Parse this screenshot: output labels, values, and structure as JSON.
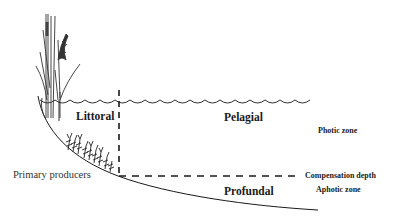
{
  "diagram": {
    "type": "lake-zonation",
    "labels": {
      "littoral": "Littoral",
      "pelagial": "Pelagial",
      "profundal": "Profundal",
      "photic_zone": "Photic zone",
      "aphotic_zone": "Aphotic zone",
      "compensation_depth": "Compensation depth",
      "primary_producers": "Primary producers"
    },
    "elements": {
      "water_surface": "wavy-line",
      "littoral_boundary": "vertical-dashed-line",
      "compensation_line": "horizontal-dashed-line",
      "lake_basin": "curved-bottom-line",
      "emergent_plants": "reed-and-cattail-icon",
      "submerged_plants": "submerged-macrophyte-icon"
    },
    "colors": {
      "line": "#1a1a1a",
      "background": "#ffffff"
    }
  }
}
